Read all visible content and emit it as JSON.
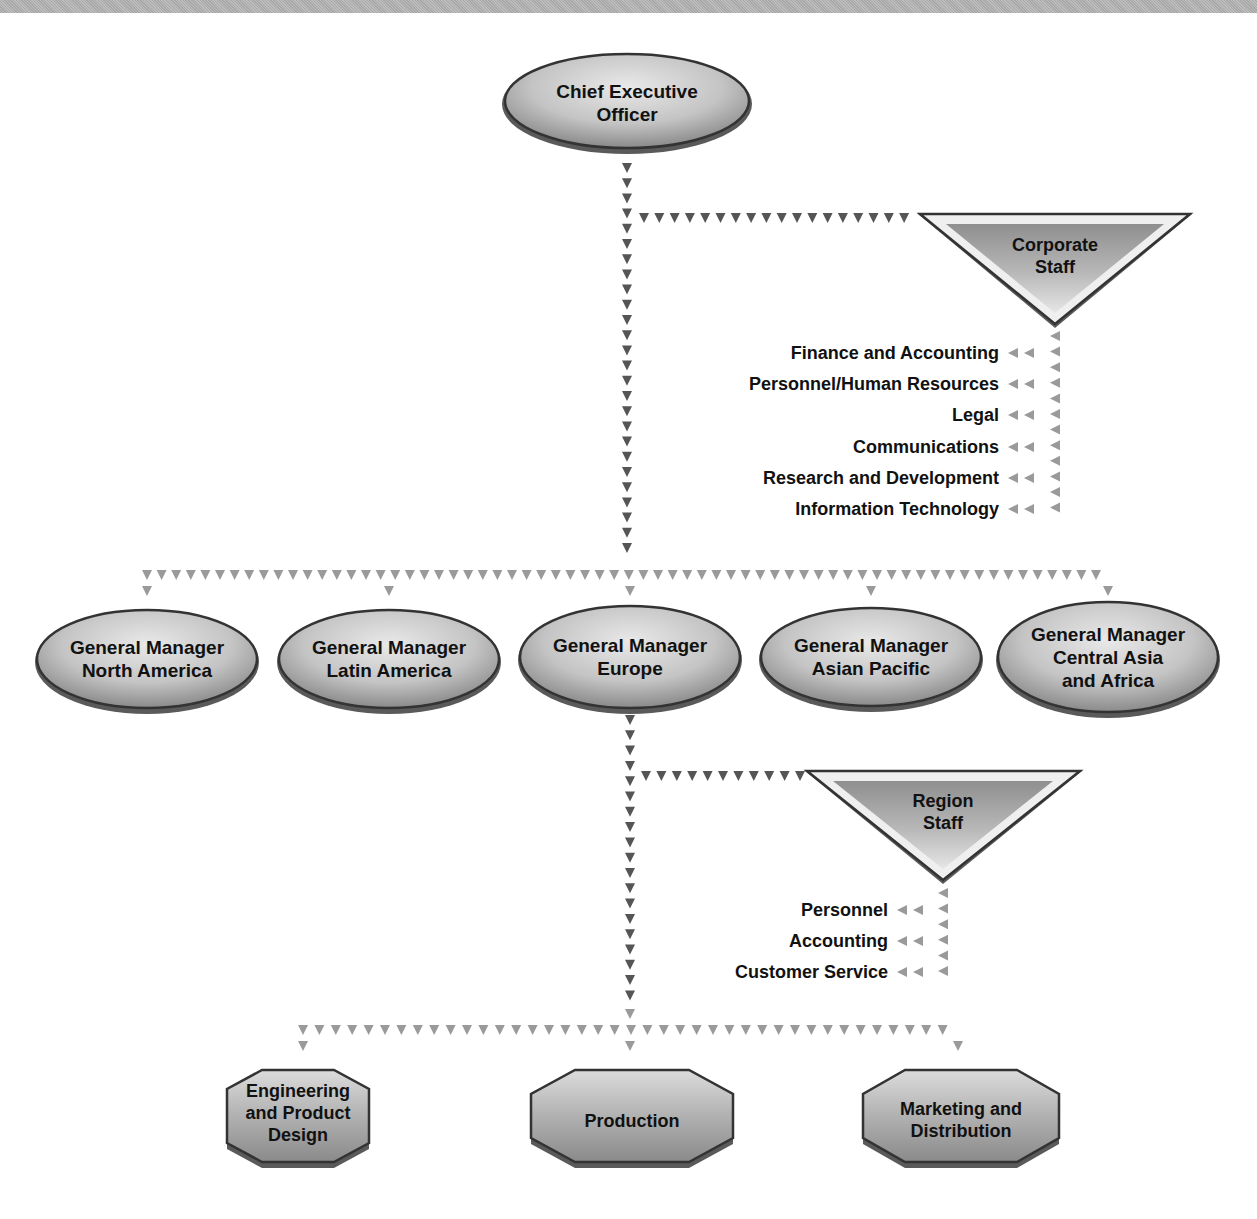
{
  "diagram": {
    "type": "organization-chart",
    "colors": {
      "node_fill_light": "#e4e4e4",
      "node_fill_dark": "#8c8c8c",
      "node_outline": "#3a3a3a",
      "arrow_dark": "#555555",
      "arrow_light": "#9a9a9a",
      "top_band": "#b0b0b0"
    },
    "ceo": {
      "line1": "Chief Executive",
      "line2": "Officer"
    },
    "corporate_staff": {
      "title_line1": "Corporate",
      "title_line2": "Staff",
      "functions": [
        "Finance and Accounting",
        "Personnel/Human Resources",
        "Legal",
        "Communications",
        "Research and Development",
        "Information Technology"
      ]
    },
    "general_managers": [
      {
        "line1": "General Manager",
        "line2": "North America",
        "line3": ""
      },
      {
        "line1": "General Manager",
        "line2": "Latin America",
        "line3": ""
      },
      {
        "line1": "General Manager",
        "line2": "Europe",
        "line3": ""
      },
      {
        "line1": "General Manager",
        "line2": "Asian Pacific",
        "line3": ""
      },
      {
        "line1": "General Manager",
        "line2": "Central Asia",
        "line3": "and Africa"
      }
    ],
    "region_staff": {
      "title_line1": "Region",
      "title_line2": "Staff",
      "functions": [
        "Personnel",
        "Accounting",
        "Customer Service"
      ]
    },
    "departments": [
      {
        "line1": "Engineering",
        "line2": "and Product",
        "line3": "Design"
      },
      {
        "line1": "Production",
        "line2": "",
        "line3": ""
      },
      {
        "line1": "Marketing and",
        "line2": "Distribution",
        "line3": ""
      }
    ]
  }
}
